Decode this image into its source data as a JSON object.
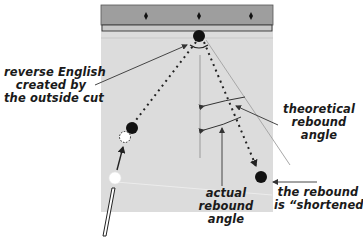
{
  "diagram": {
    "colors": {
      "felt": "#dcdcdc",
      "rail": "#9e9e9e",
      "cushion": "#c8c8c8",
      "ball": "#111111",
      "cue_ball": "#ffffff",
      "line": "#333333",
      "theoretical_line": "#a0a0a0"
    },
    "table": {
      "diamonds": 3,
      "diamond_icon": "diamond-icon"
    },
    "balls": [
      {
        "name": "object-ball-at-rail",
        "type": "black"
      },
      {
        "name": "object-ball-left",
        "type": "black"
      },
      {
        "name": "ghost-ball",
        "type": "dashed-outline"
      },
      {
        "name": "cue-ball",
        "type": "white"
      },
      {
        "name": "object-ball-final",
        "type": "black"
      }
    ],
    "labels": {
      "reverse_english": [
        "reverse English",
        "created by",
        "the outside cut"
      ],
      "theoretical": [
        "theoretical",
        "rebound",
        "angle"
      ],
      "actual": [
        "actual",
        "rebound",
        "angle"
      ],
      "shortened": [
        "the rebound",
        "is “shortened”"
      ]
    }
  }
}
